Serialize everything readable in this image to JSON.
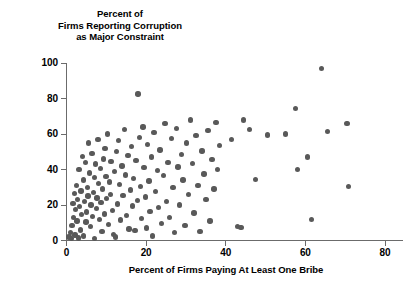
{
  "chart_data": {
    "type": "scatter",
    "title": "",
    "ylabel": "Percent of\nFirms Reporting Corruption\nas Major Constraint",
    "xlabel": "Percent of Firms Paying At Least One Bribe",
    "xlim": [
      0,
      85
    ],
    "ylim": [
      0,
      100
    ],
    "xticks": [
      0,
      20,
      40,
      60,
      80
    ],
    "yticks": [
      0,
      20,
      40,
      60,
      80,
      100
    ],
    "xtick_labels": [
      "0",
      "20",
      "40",
      "60",
      "80"
    ],
    "ytick_labels": [
      "0",
      "20",
      "40",
      "60",
      "80",
      "100"
    ],
    "grid": false,
    "legend": null,
    "marker_color": "#595959",
    "axis_color": "#6b6b6b",
    "points": [
      [
        0.6,
        2.0
      ],
      [
        1.0,
        4.5
      ],
      [
        1.2,
        1.0
      ],
      [
        1.4,
        8.5
      ],
      [
        1.6,
        21.0
      ],
      [
        1.8,
        13.0
      ],
      [
        2.0,
        26.5
      ],
      [
        2.1,
        3.0
      ],
      [
        2.3,
        17.5
      ],
      [
        2.5,
        31.0
      ],
      [
        2.6,
        11.0
      ],
      [
        2.8,
        23.0
      ],
      [
        3.0,
        1.5
      ],
      [
        3.1,
        40.0
      ],
      [
        3.3,
        19.0
      ],
      [
        3.5,
        6.0
      ],
      [
        3.6,
        28.0
      ],
      [
        3.8,
        14.5
      ],
      [
        4.0,
        47.5
      ],
      [
        4.2,
        34.0
      ],
      [
        4.3,
        2.5
      ],
      [
        4.5,
        22.0
      ],
      [
        4.7,
        44.0
      ],
      [
        4.9,
        10.5
      ],
      [
        5.0,
        16.0
      ],
      [
        5.2,
        30.0
      ],
      [
        5.4,
        25.0
      ],
      [
        5.6,
        55.0
      ],
      [
        5.8,
        38.0
      ],
      [
        6.0,
        8.0
      ],
      [
        6.2,
        20.0
      ],
      [
        6.4,
        49.0
      ],
      [
        6.6,
        13.5
      ],
      [
        6.8,
        27.0
      ],
      [
        7.0,
        35.5
      ],
      [
        7.1,
        1.0
      ],
      [
        7.3,
        43.0
      ],
      [
        7.5,
        18.0
      ],
      [
        7.7,
        24.0
      ],
      [
        7.9,
        57.0
      ],
      [
        8.1,
        32.0
      ],
      [
        8.3,
        12.0
      ],
      [
        8.5,
        40.5
      ],
      [
        8.7,
        21.5
      ],
      [
        8.9,
        5.0
      ],
      [
        9.1,
        29.0
      ],
      [
        9.3,
        46.0
      ],
      [
        9.5,
        15.0
      ],
      [
        9.7,
        52.0
      ],
      [
        9.9,
        36.0
      ],
      [
        10.1,
        23.5
      ],
      [
        10.3,
        60.0
      ],
      [
        10.5,
        9.0
      ],
      [
        10.8,
        33.0
      ],
      [
        11.0,
        26.0
      ],
      [
        11.2,
        44.5
      ],
      [
        11.5,
        17.0
      ],
      [
        11.8,
        3.5
      ],
      [
        12.0,
        39.0
      ],
      [
        12.3,
        2.0
      ],
      [
        12.5,
        50.0
      ],
      [
        12.8,
        20.5
      ],
      [
        13.0,
        56.5
      ],
      [
        13.3,
        31.5
      ],
      [
        13.6,
        11.5
      ],
      [
        13.9,
        42.0
      ],
      [
        14.2,
        25.5
      ],
      [
        14.5,
        62.5
      ],
      [
        14.8,
        37.0
      ],
      [
        15.1,
        14.0
      ],
      [
        15.4,
        48.0
      ],
      [
        15.7,
        6.5
      ],
      [
        16.0,
        28.5
      ],
      [
        16.3,
        53.0
      ],
      [
        16.6,
        19.5
      ],
      [
        16.9,
        35.0
      ],
      [
        17.2,
        5.5
      ],
      [
        17.5,
        45.0
      ],
      [
        17.8,
        22.5
      ],
      [
        18.0,
        82.5
      ],
      [
        18.3,
        58.0
      ],
      [
        18.6,
        30.5
      ],
      [
        18.9,
        12.5
      ],
      [
        19.2,
        64.0
      ],
      [
        19.5,
        41.0
      ],
      [
        19.8,
        24.5
      ],
      [
        20.1,
        7.0
      ],
      [
        20.4,
        54.0
      ],
      [
        20.7,
        33.5
      ],
      [
        21.0,
        16.5
      ],
      [
        21.3,
        47.0
      ],
      [
        21.6,
        2.5
      ],
      [
        22.0,
        61.0
      ],
      [
        22.4,
        27.5
      ],
      [
        22.8,
        39.5
      ],
      [
        23.1,
        18.5
      ],
      [
        23.5,
        51.0
      ],
      [
        23.9,
        9.5
      ],
      [
        24.3,
        36.5
      ],
      [
        24.7,
        66.0
      ],
      [
        25.1,
        22.0
      ],
      [
        25.5,
        44.0
      ],
      [
        25.9,
        13.0
      ],
      [
        26.3,
        57.5
      ],
      [
        26.7,
        30.0
      ],
      [
        27.1,
        4.5
      ],
      [
        27.6,
        63.0
      ],
      [
        28.0,
        41.5
      ],
      [
        28.4,
        20.0
      ],
      [
        28.9,
        48.5
      ],
      [
        29.3,
        34.0
      ],
      [
        29.8,
        8.5
      ],
      [
        30.2,
        55.0
      ],
      [
        30.7,
        26.0
      ],
      [
        31.1,
        68.0
      ],
      [
        31.6,
        43.5
      ],
      [
        32.0,
        15.5
      ],
      [
        32.5,
        59.0
      ],
      [
        33.0,
        31.0
      ],
      [
        33.5,
        5.0
      ],
      [
        34.0,
        50.5
      ],
      [
        34.5,
        37.5
      ],
      [
        35.0,
        23.0
      ],
      [
        35.5,
        62.0
      ],
      [
        36.0,
        11.0
      ],
      [
        36.5,
        45.5
      ],
      [
        37.0,
        29.0
      ],
      [
        37.5,
        66.5
      ],
      [
        38.0,
        40.0
      ],
      [
        38.5,
        53.5
      ],
      [
        41.5,
        57.0
      ],
      [
        43.0,
        8.0
      ],
      [
        43.8,
        7.5
      ],
      [
        44.5,
        68.0
      ],
      [
        46.0,
        62.5
      ],
      [
        47.5,
        34.5
      ],
      [
        50.5,
        59.5
      ],
      [
        55.0,
        60.0
      ],
      [
        57.5,
        74.5
      ],
      [
        58.0,
        40.0
      ],
      [
        60.5,
        47.0
      ],
      [
        61.5,
        12.0
      ],
      [
        64.0,
        97.0
      ],
      [
        65.5,
        61.5
      ],
      [
        70.5,
        66.0
      ],
      [
        70.8,
        30.5
      ]
    ]
  },
  "axes": {
    "y_axis_title_lines": "Percent of\nFirms Reporting Corruption\nas Major Constraint",
    "x_axis_title": "Percent of Firms Paying At Least One Bribe"
  }
}
